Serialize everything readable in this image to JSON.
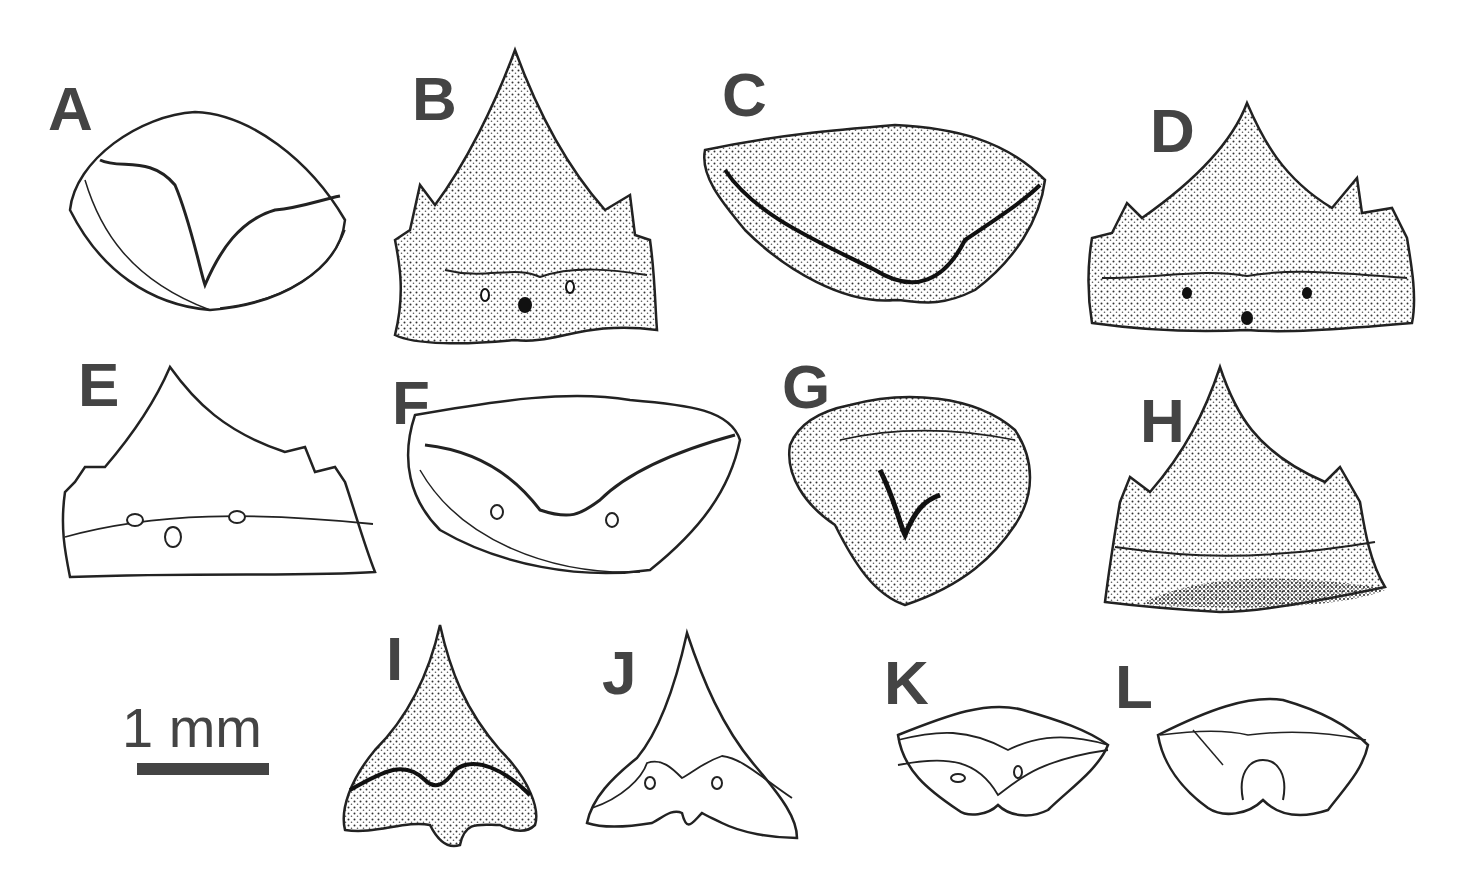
{
  "plate": {
    "labels": [
      "A",
      "B",
      "C",
      "D",
      "E",
      "F",
      "G",
      "H",
      "I",
      "J",
      "K",
      "L"
    ],
    "scale_bar": {
      "text": "1 mm"
    },
    "colors": {
      "ink": "#222222",
      "label": "#444444",
      "stipple": "#555555",
      "background": "#ffffff"
    }
  }
}
